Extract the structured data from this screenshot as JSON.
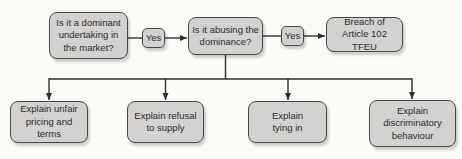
{
  "diagram": {
    "colors": {
      "background": "#fbfbf8",
      "node_fill": "#d3d2d0",
      "node_border": "#484848",
      "connector": "#2e2e2e",
      "text": "#2b2b2b"
    },
    "nodes": {
      "q_dominant": {
        "label": "Is it a dominant\nundertaking in\nthe market?"
      },
      "yes1": {
        "label": "Yes"
      },
      "q_abusing": {
        "label": "Is it abusing the\ndominance?"
      },
      "yes2": {
        "label": "Yes"
      },
      "breach": {
        "label": "Breach of\nArticle 102 TFEU"
      },
      "explain_pricing": {
        "label": "Explain unfair\npricing and terms"
      },
      "explain_refusal": {
        "label": "Explain refusal\nto supply"
      },
      "explain_tying": {
        "label": "Explain\ntying in"
      },
      "explain_discrimination": {
        "label": "Explain\ndiscriminatory\nbehaviour"
      }
    }
  }
}
